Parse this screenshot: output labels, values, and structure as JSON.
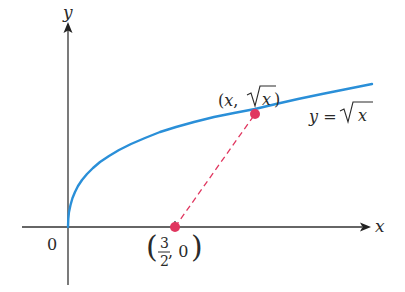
{
  "diagram": {
    "axes": {
      "x_label": "x",
      "y_label": "y",
      "origin_label": "0"
    },
    "curve": {
      "equation_label_lhs": "y =",
      "equation_label_rhs": "x",
      "color": "#2a8fd8"
    },
    "point_on_curve": {
      "label_open": "(x,",
      "label_root_arg": "x",
      "label_close": ")",
      "color": "#e0365f"
    },
    "point_on_axis": {
      "numerator": "3",
      "denominator": "2",
      "second": ", 0",
      "color": "#e0365f"
    },
    "connector": {
      "style": "dashed",
      "color": "#e0365f"
    }
  }
}
